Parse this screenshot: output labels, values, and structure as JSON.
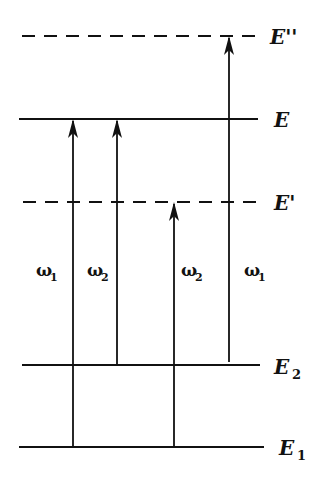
{
  "diagram": {
    "type": "energy-level-diagram",
    "levels": [
      {
        "id": "E_double_prime",
        "label": "E''",
        "subscript": "",
        "style": "dashed",
        "y": 36,
        "x1": 22,
        "x2": 258
      },
      {
        "id": "E",
        "label": "E",
        "subscript": "",
        "style": "solid",
        "y": 119,
        "x1": 19,
        "x2": 258
      },
      {
        "id": "E_prime",
        "label": "E'",
        "subscript": "",
        "style": "dashed",
        "y": 202,
        "x1": 23,
        "x2": 258
      },
      {
        "id": "E2",
        "label": "E",
        "subscript": "2",
        "style": "solid",
        "y": 365,
        "x1": 22,
        "x2": 260
      },
      {
        "id": "E1",
        "label": "E",
        "subscript": "1",
        "style": "solid",
        "y": 447,
        "x1": 19,
        "x2": 264
      }
    ],
    "transitions": [
      {
        "from": "E1",
        "to": "E",
        "x": 73,
        "label": "ω",
        "subscript": "1",
        "label_side": "left"
      },
      {
        "from": "E2",
        "to": "E",
        "x": 117,
        "label": "ω",
        "subscript": "2",
        "label_side": "left"
      },
      {
        "from": "E1",
        "to": "E_prime",
        "x": 174,
        "label": "ω",
        "subscript": "2",
        "label_side": "right"
      },
      {
        "from": "E2",
        "to": "E_double_prime",
        "x": 229,
        "label": "ω",
        "subscript": "1",
        "label_side": "left"
      }
    ],
    "colors": {
      "line": "#111111",
      "background": "#ffffff"
    }
  },
  "labels": {
    "E_double_prime": "E''",
    "E": "E",
    "E_prime": "E'",
    "E2_main": "E",
    "E2_sub": "2",
    "E1_main": "E",
    "E1_sub": "1",
    "omega": "ω",
    "t1_sub": "1",
    "t2_sub": "2",
    "t3_sub": "2",
    "t4_sub": "1"
  }
}
